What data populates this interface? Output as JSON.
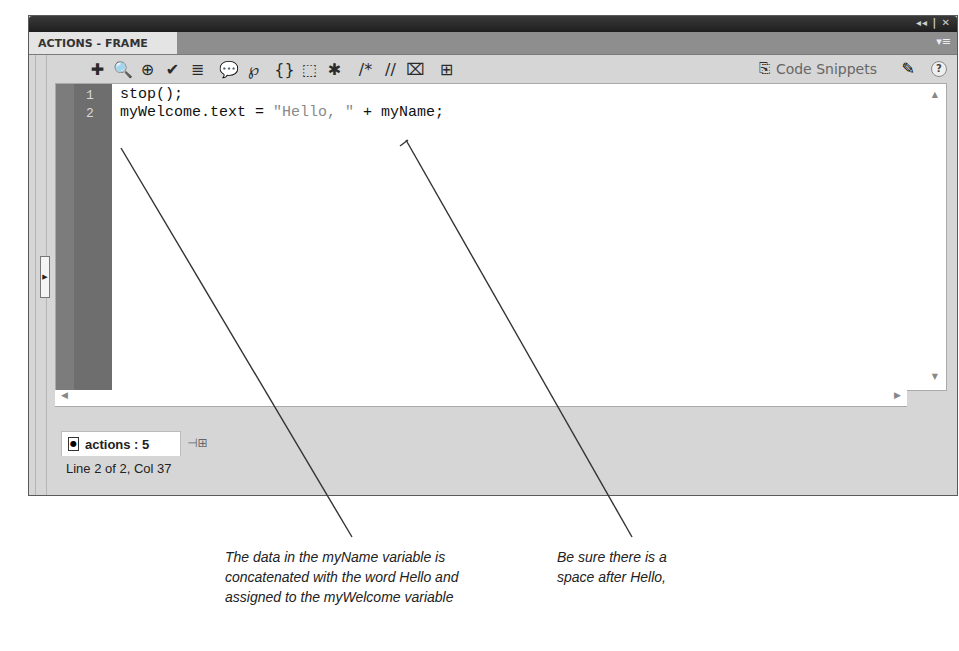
{
  "panel": {
    "title": "ACTIONS - FRAME",
    "window_controls": "◂◂ | ✕",
    "panel_menu_icon": "▾≡"
  },
  "toolbar": {
    "buttons": [
      {
        "name": "add-statement-icon",
        "glyph": "✚"
      },
      {
        "name": "find-icon",
        "glyph": "🔍"
      },
      {
        "name": "insert-target-path-icon",
        "glyph": "⊕"
      },
      {
        "name": "check-syntax-icon",
        "glyph": "✔"
      },
      {
        "name": "auto-format-icon",
        "glyph": "≣"
      },
      {
        "name": "show-code-hint-icon",
        "glyph": "💬"
      },
      {
        "name": "debug-options-icon",
        "glyph": "℘"
      },
      {
        "name": "collapse-between-braces-icon",
        "glyph": "{}"
      },
      {
        "name": "collapse-selection-icon",
        "glyph": "⬚"
      },
      {
        "name": "expand-all-icon",
        "glyph": "✱"
      },
      {
        "name": "apply-block-comment-icon",
        "glyph": "/*"
      },
      {
        "name": "apply-line-comment-icon",
        "glyph": "//"
      },
      {
        "name": "remove-comment-icon",
        "glyph": "⌧"
      },
      {
        "name": "show-hide-toolbox-icon",
        "glyph": "⊞"
      }
    ],
    "code_snippets_label": "Code Snippets",
    "code_snippets_icon": "⎘",
    "wizard_icon": "✎",
    "help_icon": "?"
  },
  "editor": {
    "lines": [
      {
        "number": "1",
        "code_before": "stop();",
        "string": "",
        "code_after": ""
      },
      {
        "number": "2",
        "code_before": "myWelcome.text = ",
        "string": "\"Hello, \"",
        "code_after": " + myName;"
      }
    ]
  },
  "footer": {
    "doc_tab_label": "actions : 5",
    "status": "Line 2 of 2, Col 37"
  },
  "callouts": [
    {
      "text_lines": [
        "The data in the myName variable is",
        "concatenated with the word Hello and",
        "assigned to the myWelcome variable"
      ]
    },
    {
      "text_lines": [
        "Be sure there is a",
        "space after Hello,"
      ]
    }
  ]
}
